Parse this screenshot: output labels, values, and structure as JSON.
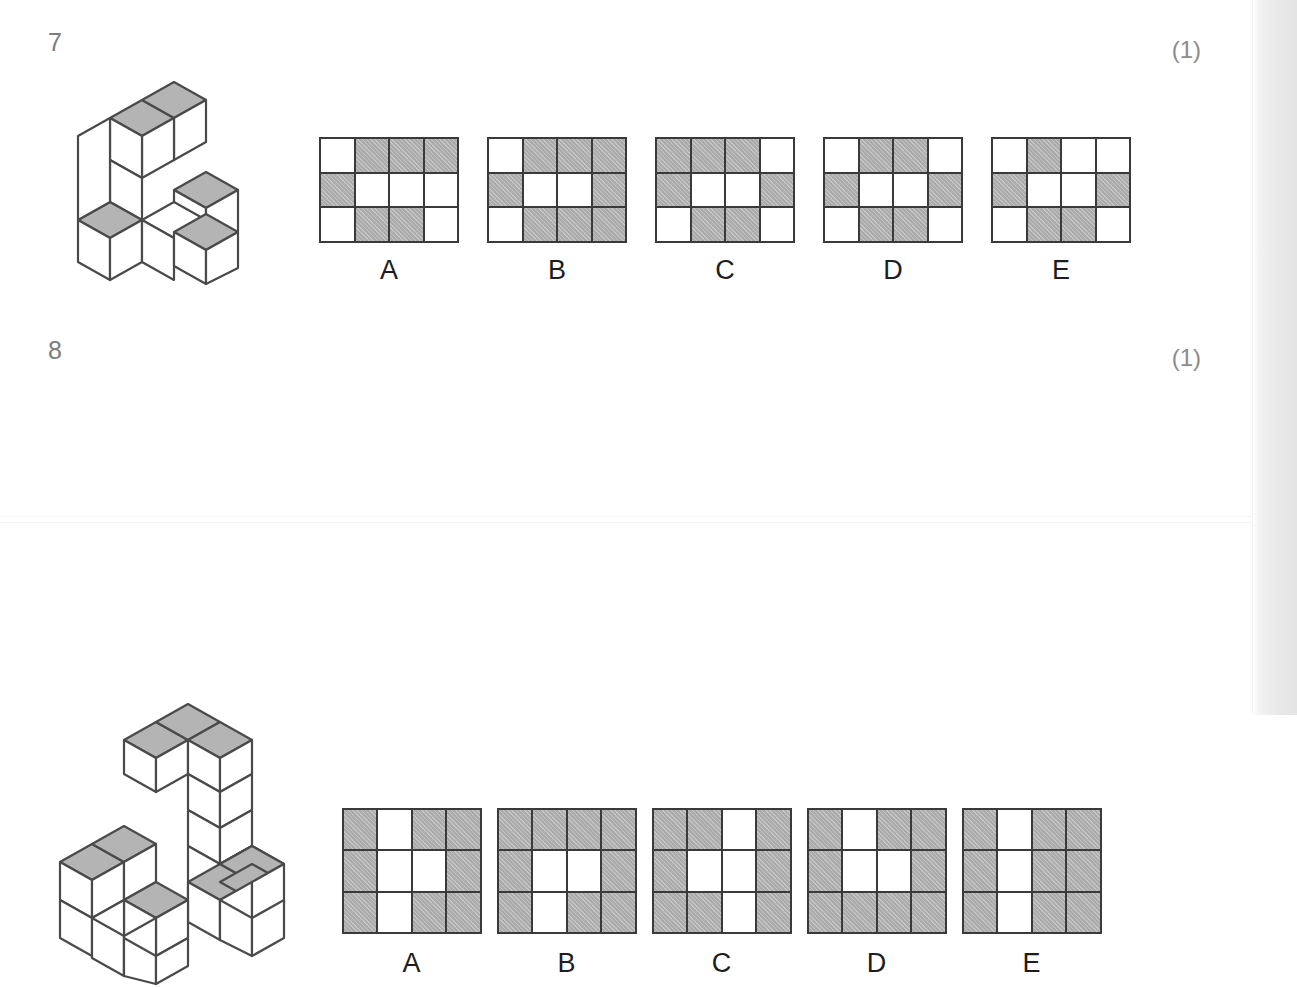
{
  "page": {
    "background_color": "#ffffff",
    "grid_shaded_color": "#b4b4b4",
    "grid_empty_color": "#ffffff",
    "grid_line_color": "#3a3a3a",
    "question_number_color": "#7c7c7c",
    "marks_color": "#8b8b8b",
    "label_color": "#1d1d1d",
    "solid_top_face_color": "#b4b4b4",
    "solid_side_face_color": "#ffffff",
    "solid_outline_color": "#4a4a4a"
  },
  "questions": [
    {
      "number": "7",
      "marks": "(1)",
      "figure_name": "isometric-cube-solid-7",
      "options": [
        {
          "label": "A",
          "rows": [
            [
              "white",
              "shaded",
              "shaded",
              "shaded"
            ],
            [
              "shaded",
              "white",
              "white",
              "white"
            ],
            [
              "white",
              "shaded",
              "shaded",
              "white"
            ]
          ]
        },
        {
          "label": "B",
          "rows": [
            [
              "white",
              "shaded",
              "shaded",
              "shaded"
            ],
            [
              "shaded",
              "white",
              "white",
              "shaded"
            ],
            [
              "white",
              "shaded",
              "shaded",
              "shaded"
            ]
          ]
        },
        {
          "label": "C",
          "rows": [
            [
              "shaded",
              "shaded",
              "shaded",
              "white"
            ],
            [
              "shaded",
              "white",
              "white",
              "shaded"
            ],
            [
              "white",
              "shaded",
              "shaded",
              "white"
            ]
          ]
        },
        {
          "label": "D",
          "rows": [
            [
              "white",
              "shaded",
              "shaded",
              "white"
            ],
            [
              "shaded",
              "white",
              "white",
              "shaded"
            ],
            [
              "white",
              "shaded",
              "shaded",
              "white"
            ]
          ]
        },
        {
          "label": "E",
          "rows": [
            [
              "white",
              "shaded",
              "white",
              "white"
            ],
            [
              "shaded",
              "white",
              "white",
              "shaded"
            ],
            [
              "white",
              "shaded",
              "shaded",
              "white"
            ]
          ]
        }
      ]
    },
    {
      "number": "8",
      "marks": "(1)",
      "figure_name": "isometric-cube-solid-8",
      "options": [
        {
          "label": "A",
          "rows": [
            [
              "shaded",
              "white",
              "shaded",
              "shaded"
            ],
            [
              "shaded",
              "white",
              "white",
              "shaded"
            ],
            [
              "shaded",
              "white",
              "shaded",
              "shaded"
            ]
          ]
        },
        {
          "label": "B",
          "rows": [
            [
              "shaded",
              "shaded",
              "shaded",
              "shaded"
            ],
            [
              "shaded",
              "white",
              "white",
              "shaded"
            ],
            [
              "shaded",
              "white",
              "shaded",
              "shaded"
            ]
          ]
        },
        {
          "label": "C",
          "rows": [
            [
              "shaded",
              "shaded",
              "white",
              "shaded"
            ],
            [
              "shaded",
              "white",
              "white",
              "shaded"
            ],
            [
              "shaded",
              "shaded",
              "white",
              "shaded"
            ]
          ]
        },
        {
          "label": "D",
          "rows": [
            [
              "shaded",
              "white",
              "shaded",
              "shaded"
            ],
            [
              "shaded",
              "white",
              "white",
              "shaded"
            ],
            [
              "shaded",
              "shaded",
              "shaded",
              "shaded"
            ]
          ]
        },
        {
          "label": "E",
          "rows": [
            [
              "shaded",
              "white",
              "shaded",
              "shaded"
            ],
            [
              "shaded",
              "white",
              "shaded",
              "shaded"
            ],
            [
              "shaded",
              "white",
              "shaded",
              "shaded"
            ]
          ]
        }
      ]
    }
  ]
}
